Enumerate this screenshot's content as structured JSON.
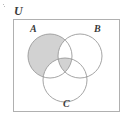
{
  "figure": {
    "type": "venn-diagram",
    "title": "",
    "universe_label": "U",
    "set_labels": {
      "a": "A",
      "b": "B",
      "c": "C"
    },
    "sets": [
      {
        "id": "A",
        "label": "A",
        "cx": 50,
        "cy": 56,
        "r": 22
      },
      {
        "id": "B",
        "label": "B",
        "cx": 80,
        "cy": 56,
        "r": 22
      },
      {
        "id": "C",
        "label": "C",
        "cx": 65,
        "cy": 80,
        "r": 22
      }
    ],
    "universe_rect": {
      "x": 13,
      "y": 19,
      "width": 107,
      "height": 93
    },
    "shaded_regions": [
      "A-only",
      "A-intersect-B-intersect-C"
    ],
    "unshaded_regions": [
      "B-only",
      "C-only",
      "A-intersect-B-only",
      "A-intersect-C-only",
      "B-intersect-C-only",
      "outside-all-sets"
    ],
    "colors": {
      "shading": "#d2d2d2",
      "outline": "#9a9a9a",
      "universe_border": "#b0b0b0",
      "label": "#3a3a3a",
      "background": "#ffffff"
    }
  }
}
